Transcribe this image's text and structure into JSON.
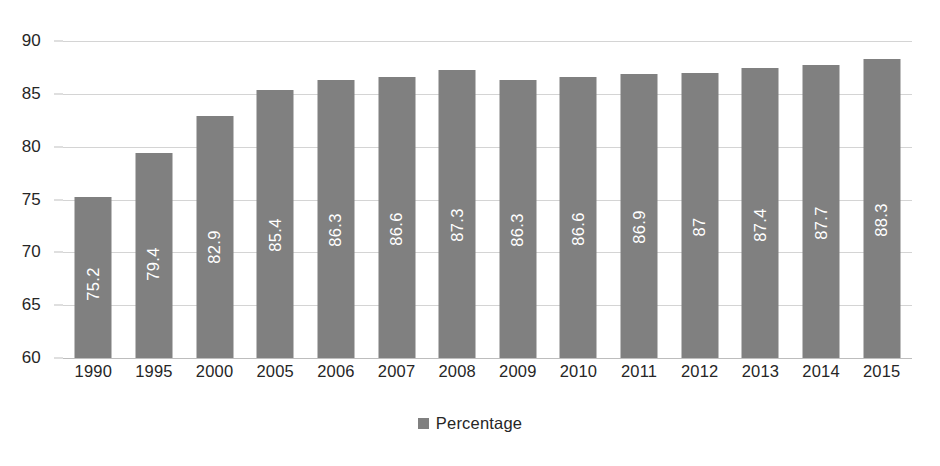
{
  "chart_data": {
    "type": "bar",
    "title": "",
    "subtitle": "",
    "xlabel": "",
    "ylabel": "",
    "categories": [
      "1990",
      "1995",
      "2000",
      "2005",
      "2006",
      "2007",
      "2008",
      "2009",
      "2010",
      "2011",
      "2012",
      "2013",
      "2014",
      "2015"
    ],
    "series": [
      {
        "name": "Percentage",
        "color": "#808080",
        "values": [
          75.2,
          79.4,
          82.9,
          85.4,
          86.3,
          86.6,
          87.3,
          86.3,
          86.6,
          86.9,
          87,
          87.4,
          87.7,
          88.3
        ],
        "value_labels": [
          "75.2",
          "79.4",
          "82.9",
          "85.4",
          "86.3",
          "86.6",
          "87.3",
          "86.3",
          "86.6",
          "86.9",
          "87",
          "87.4",
          "87.7",
          "88.3"
        ]
      }
    ],
    "ylim": [
      60,
      90
    ],
    "y_ticks": [
      60,
      65,
      70,
      75,
      80,
      85,
      90
    ],
    "y_tick_labels": [
      "60",
      "65",
      "70",
      "75",
      "80",
      "85",
      "90"
    ],
    "grid": true,
    "grid_color": "#d4d4d4",
    "legend": {
      "position": "bottom-center",
      "entries": [
        {
          "label": "Percentage",
          "color": "#808080",
          "marker": "square-swatch"
        }
      ]
    },
    "data_label_orientation": "rotated-90-ccw",
    "data_label_color": "#ffffff",
    "axis_text_color": "#262626",
    "background": "#ffffff"
  }
}
